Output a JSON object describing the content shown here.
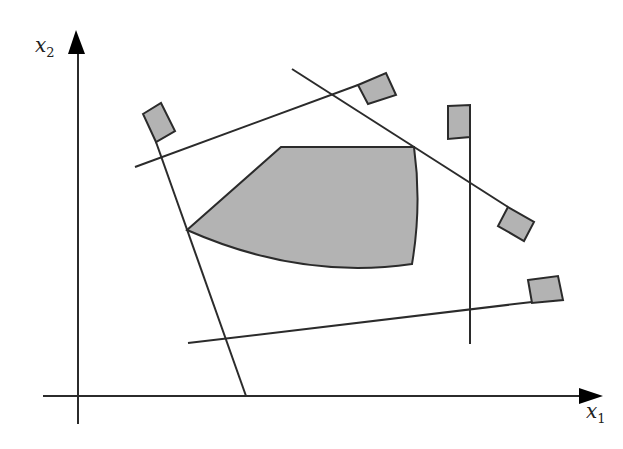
{
  "diagram": {
    "type": "feasible-region-with-constraints",
    "colors": {
      "line": "#2b2b2b",
      "fill": "#b3b3b3",
      "background": "#ffffff"
    },
    "axes": {
      "x": {
        "label": "x",
        "subscript": "1"
      },
      "y": {
        "label": "x",
        "subscript": "2"
      }
    },
    "constraints_count": 5,
    "feasible_region": {
      "label": "feasible region",
      "shaded": true
    }
  }
}
